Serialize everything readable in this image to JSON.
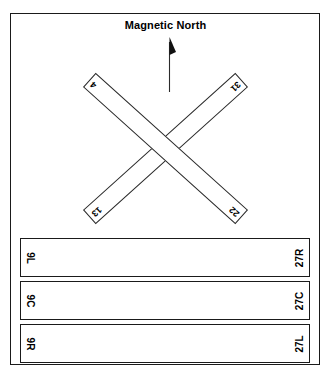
{
  "diagram": {
    "title": "Magnetic North",
    "north_arrow_icon": "north-arrow-icon",
    "frame_color": "#1a1a1a",
    "background_color": "#ffffff"
  },
  "crossing_runways": [
    {
      "id": "strip-13-31",
      "start_label": "13",
      "end_label": "31",
      "orientation_deg": -42
    },
    {
      "id": "strip-4-22",
      "start_label": "4",
      "end_label": "22",
      "orientation_deg": 42
    }
  ],
  "parallel_runways": [
    {
      "left_label": "9L",
      "right_label": "27R"
    },
    {
      "left_label": "9C",
      "right_label": "27C"
    },
    {
      "left_label": "9R",
      "right_label": "27L"
    }
  ]
}
